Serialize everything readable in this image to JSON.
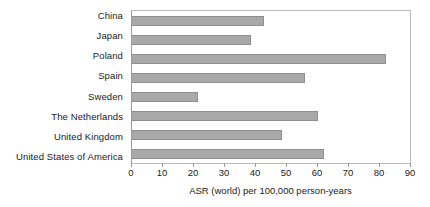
{
  "chart_data": {
    "type": "bar",
    "orientation": "horizontal",
    "title": "",
    "xlabel": "ASR (world) per 100,000 person-years",
    "ylabel": "",
    "xlim": [
      0,
      90
    ],
    "xticks": [
      0,
      10,
      20,
      30,
      40,
      50,
      60,
      70,
      80,
      90
    ],
    "grid": false,
    "legend": null,
    "bar_color": "#a9a9a9",
    "bar_edge_color": "#8f8f8f",
    "plot_border_color": "#b9b9b9",
    "categories": [
      "China",
      "Japan",
      "Poland",
      "Spain",
      "Sweden",
      "The Netherlands",
      "United Kingdom",
      "United States of America"
    ],
    "values": [
      42.7,
      38.5,
      82.2,
      56.0,
      21.4,
      60.2,
      48.5,
      62.1
    ],
    "bars": [
      {
        "category": "China",
        "value": 42.7
      },
      {
        "category": "Japan",
        "value": 38.5
      },
      {
        "category": "Poland",
        "value": 82.2
      },
      {
        "category": "Spain",
        "value": 56.0
      },
      {
        "category": "Sweden",
        "value": 21.4
      },
      {
        "category": "The Netherlands",
        "value": 60.2
      },
      {
        "category": "United Kingdom",
        "value": 48.5
      },
      {
        "category": "United States of America",
        "value": 62.1
      }
    ]
  }
}
